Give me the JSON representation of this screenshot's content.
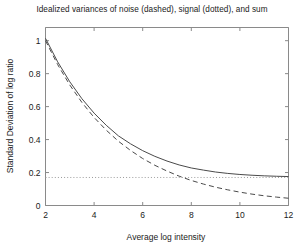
{
  "chart_data": {
    "type": "line",
    "title": "Idealized variances of noise (dashed), signal (dotted), and sum",
    "xlabel": "Average log intensity",
    "ylabel": "Standard Deviation of log ratio",
    "xlim": [
      2,
      12
    ],
    "ylim": [
      0,
      1.08
    ],
    "xticks": [
      2,
      4,
      6,
      8,
      10,
      12
    ],
    "xtick_labels": [
      "2",
      "4",
      "6",
      "8",
      "10",
      "12"
    ],
    "yticks": [
      0,
      0.2,
      0.4,
      0.6,
      0.8,
      1
    ],
    "ytick_labels": [
      "0",
      "0.2",
      "0.4",
      "0.6",
      "0.8",
      "1"
    ],
    "grid": false,
    "legend": "none",
    "box": true,
    "x": [
      2,
      2.5,
      3,
      3.5,
      4,
      4.5,
      5,
      5.5,
      6,
      6.5,
      7,
      7.5,
      8,
      8.5,
      9,
      9.5,
      10,
      10.5,
      11,
      11.5,
      12
    ],
    "series": [
      {
        "name": "noise",
        "style": "dashed",
        "color": "#4a4a4a",
        "values": [
          1.0,
          0.855,
          0.731,
          0.625,
          0.534,
          0.457,
          0.39,
          0.334,
          0.285,
          0.244,
          0.209,
          0.178,
          0.152,
          0.13,
          0.111,
          0.095,
          0.081,
          0.069,
          0.059,
          0.051,
          0.044
        ]
      },
      {
        "name": "signal",
        "style": "dotted",
        "color": "#9b9b9b",
        "values": [
          0.17,
          0.17,
          0.17,
          0.17,
          0.17,
          0.17,
          0.17,
          0.17,
          0.17,
          0.17,
          0.17,
          0.17,
          0.17,
          0.17,
          0.17,
          0.17,
          0.17,
          0.17,
          0.17,
          0.17,
          0.17
        ]
      },
      {
        "name": "sum",
        "style": "solid",
        "color": "#4a4a4a",
        "values": [
          1.0143,
          0.8717,
          0.7505,
          0.6477,
          0.5604,
          0.4866,
          0.4226,
          0.3742,
          0.3327,
          0.2983,
          0.2697,
          0.2461,
          0.2277,
          0.2148,
          0.2031,
          0.1947,
          0.1883,
          0.1836,
          0.18,
          0.1775,
          0.1756
        ]
      }
    ]
  }
}
